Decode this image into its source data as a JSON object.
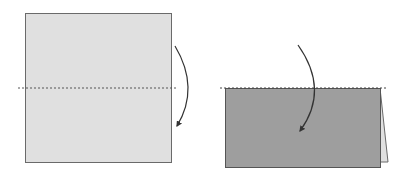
{
  "diagram": {
    "steps": [
      {
        "id": "step-1",
        "shape": "square",
        "fill": "#e0e0e0",
        "stroke": "#555555",
        "fold_line": "dashed horizontal",
        "arrow": "fold down"
      },
      {
        "id": "step-2",
        "shape": "folded rectangle",
        "fill": "#9e9e9e",
        "stroke": "#555555",
        "flap_fill": "#e0e0e0",
        "fold_line": "dashed top edge",
        "arrow": "fold down"
      }
    ],
    "colors": {
      "paper_light": "#e0e0e0",
      "paper_dark": "#9e9e9e",
      "outline": "#555555",
      "arrow": "#333333",
      "fold_line": "#444444"
    }
  }
}
